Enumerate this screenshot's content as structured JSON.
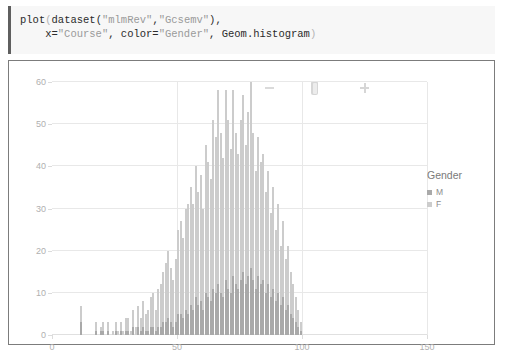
{
  "code_cell": {
    "language": "julia",
    "line1_parts": [
      {
        "t": "plot",
        "cls": "tok-plain"
      },
      {
        "t": "(",
        "cls": "tok-paren"
      },
      {
        "t": "dataset(",
        "cls": "tok-plain"
      },
      {
        "t": "\"mlmRev\"",
        "cls": "tok-str"
      },
      {
        "t": ",",
        "cls": "tok-plain"
      },
      {
        "t": "\"Gcsemv\"",
        "cls": "tok-str"
      },
      {
        "t": "),",
        "cls": "tok-plain"
      }
    ],
    "line2_parts": [
      {
        "t": "    x=",
        "cls": "tok-plain"
      },
      {
        "t": "\"Course\"",
        "cls": "tok-str"
      },
      {
        "t": ", color=",
        "cls": "tok-plain"
      },
      {
        "t": "\"Gender\"",
        "cls": "tok-str"
      },
      {
        "t": ", Geom.histogram",
        "cls": "tok-plain"
      },
      {
        "t": ")",
        "cls": "tok-paren"
      }
    ],
    "line1_text": "plot(dataset(\"mlmRev\",\"Gcsemv\"),",
    "line2_text": "    x=\"Course\", color=\"Gender\", Geom.histogram)"
  },
  "toolbar": {
    "zoom_out_label": "−",
    "slider_label": "zoom-slider",
    "zoom_in_label": "+"
  },
  "legend": {
    "title": "Gender",
    "entries": [
      {
        "label": "M",
        "color": "#a9a9a9"
      },
      {
        "label": "F",
        "color": "#cccccc"
      }
    ]
  },
  "faint_mark": "",
  "chart_data": {
    "type": "bar",
    "subtype": "stacked-histogram",
    "title": "",
    "xlabel": "Course",
    "ylabel": "",
    "xlim": [
      0,
      150
    ],
    "ylim": [
      0,
      60
    ],
    "xticks": [
      0,
      50,
      100,
      150
    ],
    "yticks": [
      0,
      10,
      20,
      30,
      40,
      50,
      60
    ],
    "grid": true,
    "legend": {
      "title": "Gender",
      "position": "right",
      "entries": [
        "M",
        "F"
      ]
    },
    "colors": {
      "M": "#a9a9a9",
      "F": "#cccccc"
    },
    "bin_width": 1,
    "series": [
      {
        "name": "M",
        "values": [
          0,
          0,
          0,
          0,
          0,
          0,
          0,
          0,
          0,
          0,
          0,
          3,
          0,
          0,
          0,
          0,
          0,
          1,
          0,
          1,
          1,
          0,
          1,
          0,
          0,
          1,
          0,
          1,
          0,
          1,
          1,
          0,
          2,
          0,
          2,
          1,
          2,
          1,
          1,
          2,
          2,
          1,
          2,
          2,
          3,
          3,
          4,
          3,
          2,
          3,
          5,
          5,
          4,
          6,
          5,
          7,
          6,
          9,
          7,
          8,
          6,
          10,
          9,
          8,
          11,
          10,
          12,
          10,
          9,
          13,
          11,
          10,
          14,
          12,
          11,
          13,
          15,
          12,
          14,
          16,
          13,
          11,
          14,
          12,
          13,
          10,
          12,
          9,
          11,
          8,
          10,
          7,
          9,
          6,
          7,
          5,
          4,
          3,
          2,
          1,
          0,
          0,
          0,
          0,
          0,
          0,
          0,
          0,
          0,
          0,
          0,
          0,
          0,
          0,
          0,
          0,
          0,
          0,
          0,
          0,
          0,
          0,
          0,
          0,
          0,
          0,
          0,
          0,
          0,
          0,
          0,
          0,
          0,
          0,
          0,
          0,
          0,
          0,
          0,
          0,
          0,
          0,
          0,
          0,
          0,
          0,
          0,
          0,
          0,
          0,
          0
        ]
      },
      {
        "name": "F",
        "values": [
          0,
          0,
          0,
          0,
          0,
          0,
          0,
          0,
          0,
          0,
          0,
          4,
          0,
          0,
          0,
          0,
          0,
          2,
          0,
          1,
          2,
          0,
          2,
          0,
          1,
          2,
          1,
          2,
          1,
          3,
          3,
          1,
          4,
          2,
          5,
          3,
          6,
          4,
          5,
          7,
          8,
          5,
          9,
          10,
          12,
          14,
          16,
          13,
          11,
          15,
          20,
          22,
          19,
          24,
          26,
          28,
          25,
          31,
          27,
          30,
          24,
          35,
          32,
          29,
          40,
          37,
          46,
          38,
          33,
          45,
          40,
          34,
          44,
          36,
          32,
          38,
          42,
          33,
          39,
          44,
          35,
          28,
          33,
          29,
          30,
          24,
          27,
          20,
          24,
          17,
          21,
          14,
          18,
          12,
          14,
          10,
          8,
          6,
          4,
          2,
          0,
          0,
          0,
          0,
          0,
          0,
          0,
          0,
          0,
          0,
          0,
          0,
          0,
          0,
          0,
          0,
          0,
          0,
          0,
          0,
          0,
          0,
          0,
          0,
          0,
          0,
          0,
          0,
          0,
          0,
          0,
          0,
          0,
          0,
          0,
          0,
          0,
          0,
          0,
          0,
          0,
          0,
          0,
          0,
          0,
          0,
          0,
          0,
          0,
          0,
          0
        ]
      }
    ]
  }
}
